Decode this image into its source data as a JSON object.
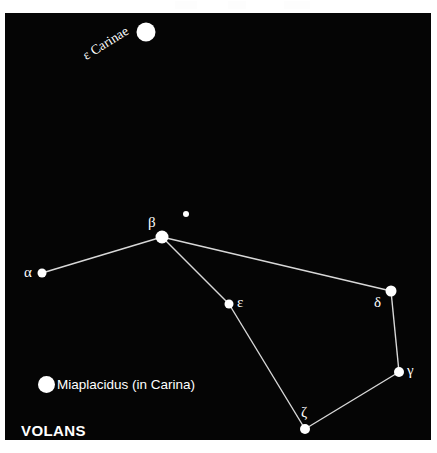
{
  "panel": {
    "background_color": "#050505",
    "page_background_color": "#ffffff",
    "star_color": "#ffffff",
    "line_color": "#d8d8d8"
  },
  "constellation": {
    "name": "VOLANS"
  },
  "legend": {
    "dot_name": "miaplacidus-star-dot",
    "text": "Miaplacidus (in Carina)"
  },
  "labels": {
    "alpha": "α",
    "beta": "β",
    "gamma": "γ",
    "delta": "δ",
    "epsilon": "ε",
    "zeta": "ζ",
    "epsilon_carinae": "ε Carinae"
  },
  "chart_data": {
    "type": "scatter",
    "title": "VOLANS",
    "xlabel": "",
    "ylabel": "",
    "xlim": [
      0,
      426
    ],
    "ylim": [
      0,
      427
    ],
    "grid": false,
    "legend_position": "bottom-left",
    "coordinate_note": "pixel coordinates within the black sky panel",
    "stars": [
      {
        "id": "epsilon-carinae",
        "label": "ε Carinae",
        "x": 141,
        "y": 19,
        "radius": 9.5,
        "label_dx": -62,
        "label_dy": 18,
        "label_rotation": -32,
        "in_constellation": false
      },
      {
        "id": "beta",
        "label": "β",
        "x": 157,
        "y": 224,
        "radius": 6.5,
        "label_dx": -14,
        "label_dy": -22,
        "label_rotation": 0,
        "in_constellation": true
      },
      {
        "id": "unnamed-faint",
        "label": "",
        "x": 181,
        "y": 201,
        "radius": 3.0,
        "label_dx": 0,
        "label_dy": 0,
        "label_rotation": 0,
        "in_constellation": false
      },
      {
        "id": "alpha",
        "label": "α",
        "x": 37,
        "y": 260,
        "radius": 4.5,
        "label_dx": -18,
        "label_dy": -8,
        "label_rotation": 0,
        "in_constellation": true
      },
      {
        "id": "epsilon",
        "label": "ε",
        "x": 224,
        "y": 291,
        "radius": 4.5,
        "label_dx": 8,
        "label_dy": -9,
        "label_rotation": 0,
        "in_constellation": true
      },
      {
        "id": "delta",
        "label": "δ",
        "x": 386,
        "y": 278,
        "radius": 5.5,
        "label_dx": -17,
        "label_dy": 4,
        "label_rotation": 0,
        "in_constellation": true
      },
      {
        "id": "gamma",
        "label": "γ",
        "x": 394,
        "y": 359,
        "radius": 5.0,
        "label_dx": 8,
        "label_dy": -9,
        "label_rotation": 0,
        "in_constellation": true
      },
      {
        "id": "zeta",
        "label": "ζ",
        "x": 300,
        "y": 416,
        "radius": 5.0,
        "label_dx": -4,
        "label_dy": -24,
        "label_rotation": 0,
        "in_constellation": true
      }
    ],
    "lines": [
      {
        "from": "alpha",
        "to": "beta"
      },
      {
        "from": "beta",
        "to": "delta"
      },
      {
        "from": "beta",
        "to": "epsilon"
      },
      {
        "from": "epsilon",
        "to": "zeta"
      },
      {
        "from": "zeta",
        "to": "gamma"
      },
      {
        "from": "gamma",
        "to": "delta"
      }
    ],
    "top_artifacts": [
      {
        "x": 175,
        "width": 22
      },
      {
        "x": 228,
        "width": 18
      },
      {
        "x": 284,
        "width": 26
      }
    ]
  }
}
